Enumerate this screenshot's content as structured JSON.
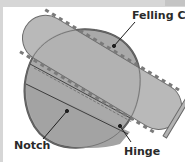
{
  "diagram": {
    "labels": {
      "felling_cut": "Felling Cut",
      "notch": "Notch",
      "hinge": "Hinge"
    },
    "colors": {
      "background": "#ffffff",
      "frame": "#d6d6d6",
      "stump_fill": "#a9a9a9",
      "stump_outline": "#5a5a5a",
      "bar_fill": "#b3b3b3",
      "bar_outline": "#6a6a6a",
      "label_text": "#2a2a2a"
    }
  }
}
